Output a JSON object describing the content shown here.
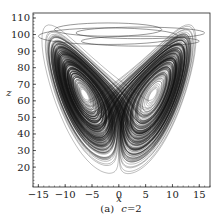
{
  "figure": {
    "caption_prefix": "(a)",
    "caption_param": "c",
    "caption_eq": "=2"
  },
  "chart_data": {
    "type": "line",
    "title": "",
    "caption": "(a) c=2",
    "xlabel": "x",
    "ylabel": "z",
    "xlim": [
      -16,
      17
    ],
    "ylim": [
      8,
      113
    ],
    "xticks": [
      -15,
      -10,
      -5,
      0,
      5,
      10,
      15
    ],
    "yticks": [
      20,
      30,
      40,
      50,
      60,
      70,
      80,
      90,
      100,
      110
    ],
    "xtick_labels": [
      "−15",
      "−10",
      "−5",
      "0",
      "5",
      "10",
      "15"
    ],
    "ytick_labels": [
      "20",
      "30",
      "40",
      "50",
      "60",
      "70",
      "80",
      "90",
      "100",
      "110"
    ],
    "grid": false,
    "legend": null,
    "series": [
      {
        "name": "trajectory",
        "color": "#111111",
        "wing_centers": [
          {
            "x": -5,
            "z": 40
          },
          {
            "x": 5,
            "z": 41
          }
        ],
        "extent": {
          "x": [
            -15,
            15
          ],
          "z": [
            12,
            106
          ]
        }
      }
    ]
  }
}
